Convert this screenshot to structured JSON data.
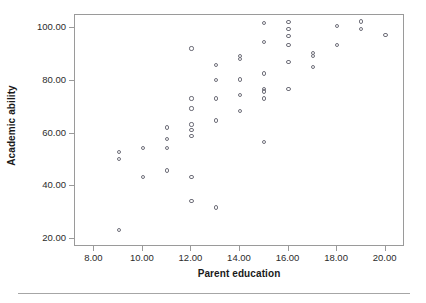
{
  "chart_data": {
    "type": "scatter",
    "title": "",
    "xlabel": "Parent education",
    "ylabel": "Academic ability",
    "xlim": [
      7.2,
      20.8
    ],
    "ylim": [
      17.0,
      105.0
    ],
    "grid": false,
    "legend": null,
    "marker": "open-circle",
    "marker_color": "#6f6f7a",
    "xticks": [
      8,
      10,
      12,
      14,
      16,
      18,
      20
    ],
    "xtick_labels": [
      "8.00",
      "10.00",
      "12.00",
      "14.00",
      "16.00",
      "18.00",
      "20.00"
    ],
    "yticks": [
      20,
      40,
      60,
      80,
      100
    ],
    "ytick_labels": [
      "20.00",
      "40.00",
      "60.00",
      "80.00",
      "100.00"
    ],
    "points": [
      {
        "x": 9,
        "y": 53.0
      },
      {
        "x": 9,
        "y": 50.5
      },
      {
        "x": 9,
        "y": 23.3
      },
      {
        "x": 10,
        "y": 54.5
      },
      {
        "x": 10,
        "y": 43.7
      },
      {
        "x": 11,
        "y": 62.3
      },
      {
        "x": 11,
        "y": 58.0
      },
      {
        "x": 11,
        "y": 54.4
      },
      {
        "x": 11,
        "y": 46.0
      },
      {
        "x": 12,
        "y": 92.3
      },
      {
        "x": 12,
        "y": 73.3
      },
      {
        "x": 12,
        "y": 69.5
      },
      {
        "x": 12,
        "y": 63.5
      },
      {
        "x": 12,
        "y": 61.5
      },
      {
        "x": 12,
        "y": 59.0
      },
      {
        "x": 12,
        "y": 43.7
      },
      {
        "x": 12,
        "y": 34.3
      },
      {
        "x": 13,
        "y": 86.0
      },
      {
        "x": 13,
        "y": 80.3
      },
      {
        "x": 13,
        "y": 73.3
      },
      {
        "x": 13,
        "y": 65.0
      },
      {
        "x": 13,
        "y": 32.0
      },
      {
        "x": 14,
        "y": 89.5
      },
      {
        "x": 14,
        "y": 88.3
      },
      {
        "x": 14,
        "y": 80.5
      },
      {
        "x": 14,
        "y": 74.6
      },
      {
        "x": 14,
        "y": 68.5
      },
      {
        "x": 15,
        "y": 102.0
      },
      {
        "x": 15,
        "y": 94.7
      },
      {
        "x": 15,
        "y": 82.8
      },
      {
        "x": 15,
        "y": 76.8
      },
      {
        "x": 15,
        "y": 76.0
      },
      {
        "x": 15,
        "y": 73.3
      },
      {
        "x": 15,
        "y": 56.8
      },
      {
        "x": 16,
        "y": 102.2
      },
      {
        "x": 16,
        "y": 99.7
      },
      {
        "x": 16,
        "y": 97.0
      },
      {
        "x": 16,
        "y": 93.5
      },
      {
        "x": 16,
        "y": 87.3
      },
      {
        "x": 16,
        "y": 77.0
      },
      {
        "x": 17,
        "y": 90.5
      },
      {
        "x": 17,
        "y": 89.3
      },
      {
        "x": 17,
        "y": 85.3
      },
      {
        "x": 18,
        "y": 100.7
      },
      {
        "x": 18,
        "y": 93.5
      },
      {
        "x": 19,
        "y": 102.5
      },
      {
        "x": 19,
        "y": 99.7
      },
      {
        "x": 20,
        "y": 97.3
      }
    ]
  }
}
